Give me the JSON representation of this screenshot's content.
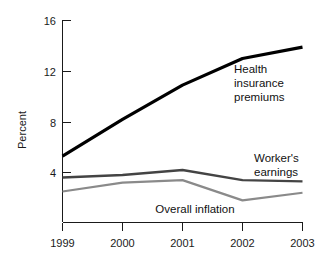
{
  "chart_data": {
    "type": "line",
    "title": "",
    "subtitle": "",
    "xlabel": "",
    "ylabel": "Percent",
    "categories": [
      "1999",
      "2000",
      "2001",
      "2002",
      "2003"
    ],
    "x": [
      1999,
      2000,
      2001,
      2002,
      2003
    ],
    "xlim": [
      1999,
      2003
    ],
    "ylim": [
      0,
      16
    ],
    "yticks": [
      4,
      8,
      12,
      16
    ],
    "ytick_labels": [
      "4",
      "8",
      "12",
      "16"
    ],
    "xticks": [
      1999,
      2000,
      2001,
      2002,
      2003
    ],
    "xtick_labels": [
      "1999",
      "2000",
      "2001",
      "2002",
      "2003"
    ],
    "grid": false,
    "legend": "inline-annotations",
    "legend_position": "inline",
    "series": [
      {
        "name": "Health insurance premiums",
        "label_lines": [
          "Health",
          "insurance",
          "premiums"
        ],
        "color": "#000000",
        "width": 3.2,
        "values": [
          5.3,
          8.2,
          10.9,
          13.0,
          13.9
        ]
      },
      {
        "name": "Worker's earnings",
        "label_lines": [
          "Worker's",
          "earnings"
        ],
        "color": "#444444",
        "width": 2.4,
        "values": [
          3.6,
          3.8,
          4.2,
          3.4,
          3.3
        ]
      },
      {
        "name": "Overall inflation",
        "label_lines": [
          "Overall inflation"
        ],
        "color": "#8a8a8a",
        "width": 2.2,
        "values": [
          2.5,
          3.2,
          3.4,
          1.8,
          2.4
        ]
      }
    ],
    "annotations": [
      {
        "text": "Health insurance premiums",
        "lines": [
          "Health",
          "insurance",
          "premiums"
        ]
      },
      {
        "text": "Worker's earnings",
        "lines": [
          "Worker's",
          "earnings"
        ]
      },
      {
        "text": "Overall inflation",
        "lines": [
          "Overall inflation"
        ]
      }
    ]
  },
  "axes": {
    "y_title": "Percent",
    "y_tick_0": "4",
    "y_tick_1": "8",
    "y_tick_2": "12",
    "y_tick_3": "16",
    "x_tick_0": "1999",
    "x_tick_1": "2000",
    "x_tick_2": "2001",
    "x_tick_3": "2002",
    "x_tick_4": "2003"
  },
  "labels": {
    "health_line_1": "Health",
    "health_line_2": "insurance",
    "health_line_3": "premiums",
    "worker_line_1": "Worker's",
    "worker_line_2": "earnings",
    "inflation_line_1": "Overall inflation"
  },
  "colors": {
    "health": "#000000",
    "worker": "#444444",
    "inflation": "#8a8a8a",
    "axis": "#1a1a1a",
    "background": "#ffffff"
  }
}
